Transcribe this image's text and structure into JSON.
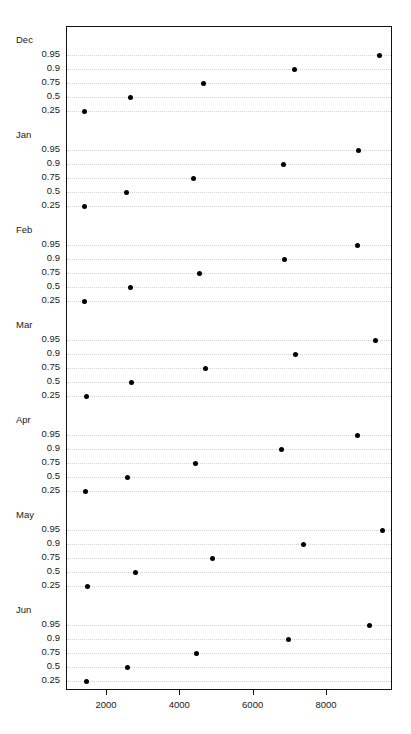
{
  "header": {
    "running_text": "",
    "page_number": ""
  },
  "chart_data": {
    "type": "scatter",
    "title": "",
    "subtitle": "",
    "xlabel": "",
    "ylabel": "",
    "xlim": [
      1200,
      9800
    ],
    "grid": true,
    "legend": null,
    "panel_label_order": [
      "Dec",
      "Jan",
      "Feb",
      "Mar",
      "Apr",
      "May",
      "Jun"
    ],
    "quantiles": [
      "0.95",
      "0.9",
      "0.75",
      "0.5",
      "0.25"
    ],
    "xticks": [
      2000,
      4000,
      6000,
      8000
    ],
    "xtick_labels": [
      "2000",
      "4000",
      "6000",
      "8000"
    ],
    "panels": [
      {
        "label": "Dec",
        "points": [
          {
            "quantile": "0.95",
            "value": 9420
          },
          {
            "quantile": "0.9",
            "value": 7100
          },
          {
            "quantile": "0.75",
            "value": 4640
          },
          {
            "quantile": "0.5",
            "value": 2650
          },
          {
            "quantile": "0.25",
            "value": 1380
          }
        ]
      },
      {
        "label": "Jan",
        "points": [
          {
            "quantile": "0.95",
            "value": 8870
          },
          {
            "quantile": "0.9",
            "value": 6800
          },
          {
            "quantile": "0.75",
            "value": 4370
          },
          {
            "quantile": "0.5",
            "value": 2545
          },
          {
            "quantile": "0.25",
            "value": 1380
          }
        ]
      },
      {
        "label": "Feb",
        "points": [
          {
            "quantile": "0.95",
            "value": 8820
          },
          {
            "quantile": "0.9",
            "value": 6830
          },
          {
            "quantile": "0.75",
            "value": 4510
          },
          {
            "quantile": "0.5",
            "value": 2650
          },
          {
            "quantile": "0.25",
            "value": 1380
          }
        ]
      },
      {
        "label": "Mar",
        "points": [
          {
            "quantile": "0.95",
            "value": 9310
          },
          {
            "quantile": "0.9",
            "value": 7130
          },
          {
            "quantile": "0.75",
            "value": 4680
          },
          {
            "quantile": "0.5",
            "value": 2680
          },
          {
            "quantile": "0.25",
            "value": 1430
          }
        ]
      },
      {
        "label": "Apr",
        "points": [
          {
            "quantile": "0.95",
            "value": 8820
          },
          {
            "quantile": "0.9",
            "value": 6750
          },
          {
            "quantile": "0.75",
            "value": 4400
          },
          {
            "quantile": "0.5",
            "value": 2570
          },
          {
            "quantile": "0.25",
            "value": 1400
          }
        ]
      },
      {
        "label": "May",
        "points": [
          {
            "quantile": "0.95",
            "value": 9500
          },
          {
            "quantile": "0.9",
            "value": 7370
          },
          {
            "quantile": "0.75",
            "value": 4890
          },
          {
            "quantile": "0.5",
            "value": 2790
          },
          {
            "quantile": "0.25",
            "value": 1480
          }
        ]
      },
      {
        "label": "Jun",
        "points": [
          {
            "quantile": "0.95",
            "value": 9150
          },
          {
            "quantile": "0.9",
            "value": 6960
          },
          {
            "quantile": "0.75",
            "value": 4450
          },
          {
            "quantile": "0.5",
            "value": 2570
          },
          {
            "quantile": "0.25",
            "value": 1430
          }
        ]
      }
    ]
  }
}
